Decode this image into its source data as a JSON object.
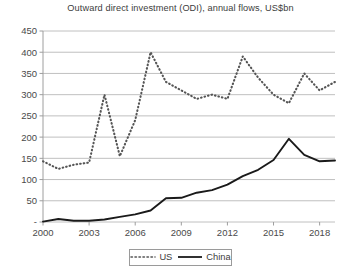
{
  "chart_data": {
    "type": "line",
    "title": "Outward direct investment (ODI), annual flows, US$bn",
    "xlabel": "",
    "ylabel": "",
    "ylim": [
      0,
      450
    ],
    "ytick_labels": [
      "450",
      "400",
      "350",
      "300",
      "250",
      "200",
      "150",
      "100",
      "50",
      "-"
    ],
    "ytick_values": [
      450,
      400,
      350,
      300,
      250,
      200,
      150,
      100,
      50,
      0
    ],
    "xlim": [
      2000,
      2019
    ],
    "xtick_labels": [
      "2000",
      "2003",
      "2006",
      "2009",
      "2012",
      "2015",
      "2018"
    ],
    "xtick_values": [
      2000,
      2003,
      2006,
      2009,
      2012,
      2015,
      2018
    ],
    "x": [
      2000,
      2001,
      2002,
      2003,
      2004,
      2005,
      2006,
      2007,
      2008,
      2009,
      2010,
      2011,
      2012,
      2013,
      2014,
      2015,
      2016,
      2017,
      2018,
      2019
    ],
    "grid": true,
    "legend_position": "bottom-center",
    "series": [
      {
        "name": "US",
        "style": "dotted",
        "color": "#555555",
        "values": [
          143,
          125,
          135,
          140,
          300,
          155,
          240,
          400,
          330,
          310,
          290,
          300,
          290,
          390,
          340,
          300,
          280,
          350,
          310,
          330
        ]
      },
      {
        "name": "China",
        "style": "solid",
        "color": "#1a1a1a",
        "values": [
          1,
          7,
          3,
          3,
          6,
          12,
          18,
          27,
          56,
          57,
          69,
          75,
          88,
          108,
          123,
          146,
          196,
          158,
          143,
          145
        ]
      }
    ]
  },
  "legend": {
    "us_label": "US",
    "china_label": "China"
  }
}
